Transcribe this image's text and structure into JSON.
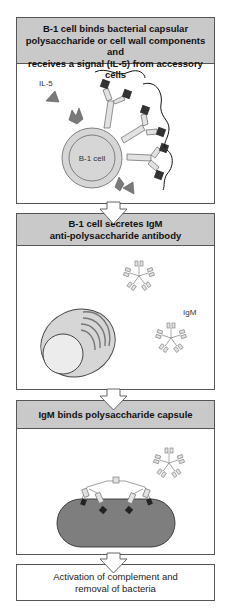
{
  "diagram": {
    "type": "flow",
    "direction": "top-to-bottom",
    "colors": {
      "header_fill": "#c9c9c9",
      "border": "#555555",
      "cell_fill": "#d6d6d6",
      "nucleus_fill": "#e4e4e4",
      "ligand_dark": "#333333",
      "il5_triangle": "#7a7a7a",
      "bacterium_fill": "#7e7e7e",
      "antibody_fill": "#e2e2e2"
    },
    "steps": [
      {
        "id": "step1",
        "title_lines": [
          "B-1 cell binds bacterial capsular",
          "polysaccharide or cell wall components and",
          "receives a signal (IL-5) from accessory cells"
        ],
        "labels": {
          "signal": "IL-5",
          "cell": "B-1 cell"
        }
      },
      {
        "id": "step2",
        "title_lines": [
          "B-1 cell secretes IgM",
          "anti-polysaccharide antibody"
        ],
        "labels": {
          "antibody": "IgM"
        }
      },
      {
        "id": "step3",
        "title_lines": [
          "IgM binds polysaccharide capsule"
        ]
      },
      {
        "id": "step4",
        "text_lines": [
          "Activation of complement and",
          "removal of bacteria"
        ]
      }
    ],
    "connections": [
      {
        "from": "step1",
        "to": "step2"
      },
      {
        "from": "step2",
        "to": "step3"
      },
      {
        "from": "step3",
        "to": "step4"
      }
    ]
  }
}
